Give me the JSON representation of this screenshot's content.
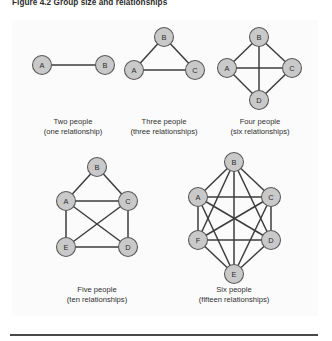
{
  "figure": {
    "title": "Figure 4.2 Group size and relationships",
    "panel_background": "#fbfbfb",
    "node_fill": "#c9c9c9",
    "node_stroke": "#5a5a5a",
    "edge_color": "#3d3d3d",
    "rule_color": "#4a4a4a"
  },
  "diagrams": [
    {
      "id": "two-people",
      "caption_line1": "Two people",
      "caption_line2": "(one relationship)",
      "people": 2,
      "relationships": 1,
      "nodes": [
        {
          "label": "A",
          "cx": 30,
          "cy": 45
        },
        {
          "label": "B",
          "cx": 93,
          "cy": 45
        }
      ],
      "edges": [
        [
          0,
          1
        ]
      ],
      "caption_x": 61,
      "caption_y1": 104,
      "caption_y2": 114
    },
    {
      "id": "three-people",
      "caption_line1": "Three people",
      "caption_line2": "(three relationships)",
      "people": 3,
      "relationships": 3,
      "nodes": [
        {
          "label": "B",
          "cx": 152,
          "cy": 17
        },
        {
          "label": "A",
          "cx": 122,
          "cy": 50
        },
        {
          "label": "C",
          "cx": 183,
          "cy": 50
        }
      ],
      "edges": [
        [
          0,
          1
        ],
        [
          0,
          2
        ],
        [
          1,
          2
        ]
      ],
      "caption_x": 152,
      "caption_y1": 104,
      "caption_y2": 114
    },
    {
      "id": "four-people",
      "caption_line1": "Four people",
      "caption_line2": "(six relationships)",
      "people": 4,
      "relationships": 6,
      "nodes": [
        {
          "label": "B",
          "cx": 247,
          "cy": 17
        },
        {
          "label": "A",
          "cx": 215,
          "cy": 48
        },
        {
          "label": "C",
          "cx": 280,
          "cy": 48
        },
        {
          "label": "D",
          "cx": 247,
          "cy": 80
        }
      ],
      "edges": [
        [
          0,
          1
        ],
        [
          0,
          2
        ],
        [
          0,
          3
        ],
        [
          1,
          2
        ],
        [
          1,
          3
        ],
        [
          2,
          3
        ]
      ],
      "caption_x": 248,
      "caption_y1": 104,
      "caption_y2": 114
    },
    {
      "id": "five-people",
      "caption_line1": "Five people",
      "caption_line2": "(ten relationships)",
      "people": 5,
      "relationships": 10,
      "nodes": [
        {
          "label": "B",
          "cx": 85,
          "cy": 147
        },
        {
          "label": "A",
          "cx": 54,
          "cy": 181
        },
        {
          "label": "C",
          "cx": 116,
          "cy": 181
        },
        {
          "label": "E",
          "cx": 54,
          "cy": 227
        },
        {
          "label": "D",
          "cx": 116,
          "cy": 227
        }
      ],
      "edges": [
        [
          0,
          1
        ],
        [
          0,
          2
        ],
        [
          1,
          2
        ],
        [
          1,
          3
        ],
        [
          1,
          4
        ],
        [
          2,
          3
        ],
        [
          2,
          4
        ],
        [
          3,
          4
        ],
        [
          0,
          3
        ],
        [
          0,
          4
        ]
      ],
      "visible_edges": [
        [
          0,
          1
        ],
        [
          0,
          2
        ],
        [
          1,
          2
        ],
        [
          1,
          3
        ],
        [
          1,
          4
        ],
        [
          2,
          3
        ],
        [
          2,
          4
        ],
        [
          3,
          4
        ]
      ],
      "caption_x": 85,
      "caption_y1": 272,
      "caption_y2": 282
    },
    {
      "id": "six-people",
      "caption_line1": "Six people",
      "caption_line2": "(fifteen relationships)",
      "people": 6,
      "relationships": 15,
      "nodes": [
        {
          "label": "B",
          "cx": 222,
          "cy": 142
        },
        {
          "label": "A",
          "cx": 186,
          "cy": 177
        },
        {
          "label": "C",
          "cx": 259,
          "cy": 177
        },
        {
          "label": "F",
          "cx": 186,
          "cy": 220
        },
        {
          "label": "D",
          "cx": 259,
          "cy": 220
        },
        {
          "label": "E",
          "cx": 222,
          "cy": 254
        }
      ],
      "edges": [
        [
          0,
          1
        ],
        [
          0,
          2
        ],
        [
          0,
          3
        ],
        [
          0,
          4
        ],
        [
          0,
          5
        ],
        [
          1,
          2
        ],
        [
          1,
          3
        ],
        [
          1,
          4
        ],
        [
          1,
          5
        ],
        [
          2,
          3
        ],
        [
          2,
          4
        ],
        [
          2,
          5
        ],
        [
          3,
          4
        ],
        [
          3,
          5
        ],
        [
          4,
          5
        ]
      ],
      "caption_x": 222,
      "caption_y1": 272,
      "caption_y2": 282
    }
  ]
}
